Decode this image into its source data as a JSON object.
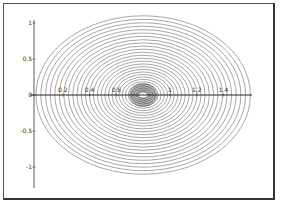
{
  "chart_data": {
    "type": "line",
    "subtype": "contour",
    "title": "",
    "xlabel": "",
    "ylabel": "",
    "xlim": [
      0,
      1.6
    ],
    "ylim": [
      -1.2,
      1.05
    ],
    "x_ticks": [
      {
        "value": 0.2,
        "label": "0.2"
      },
      {
        "value": 0.4,
        "label": "0.4"
      },
      {
        "value": 0.6,
        "label": "0.6"
      },
      {
        "value": 1.0,
        "label": "1"
      },
      {
        "value": 1.2,
        "label": "1.2"
      },
      {
        "value": 1.4,
        "label": "1.4"
      }
    ],
    "y_ticks": [
      {
        "value": 1,
        "label": "1"
      },
      {
        "value": 0.5,
        "label": "0.5"
      },
      {
        "value": 0,
        "label": "0"
      },
      {
        "value": -0.5,
        "label": "-0.5"
      },
      {
        "value": -1,
        "label": "-1"
      }
    ],
    "contours": {
      "center": [
        0.8,
        0
      ],
      "outer_semi_axis_x": 0.8,
      "outer_semi_axis_y": 1.1,
      "level_count": 30,
      "line_color": "#444444"
    },
    "grid": false,
    "legend": "none"
  }
}
